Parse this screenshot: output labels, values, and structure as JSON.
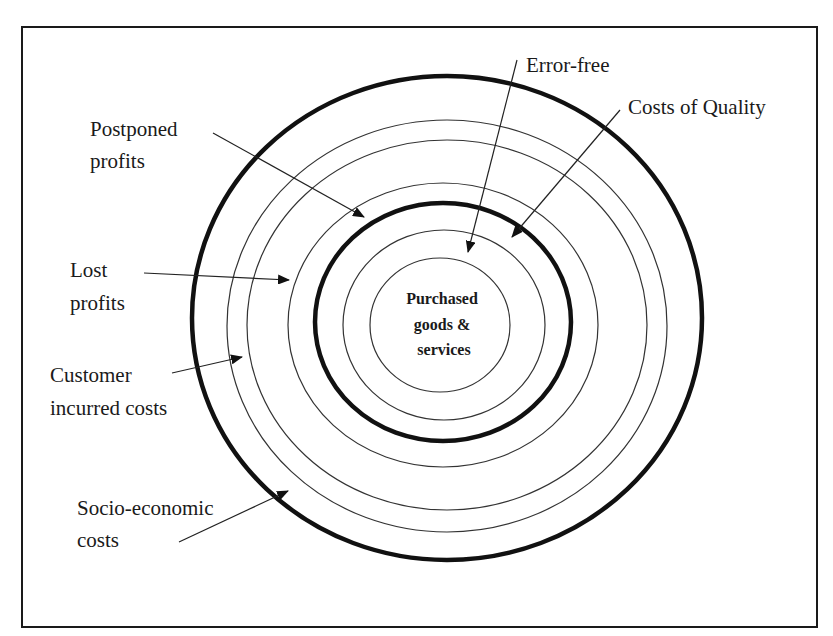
{
  "diagram": {
    "type": "concentric-rings",
    "center_label": {
      "lines": [
        "Purchased",
        "goods &",
        "services"
      ]
    },
    "labels": {
      "error_free": {
        "lines": [
          "Error-free"
        ]
      },
      "costs_of_quality": {
        "lines": [
          "Costs of Quality"
        ]
      },
      "postponed_profits": {
        "lines": [
          "Postponed",
          "profits"
        ]
      },
      "lost_profits": {
        "lines": [
          "Lost",
          "profits"
        ]
      },
      "customer_incurred_costs": {
        "lines": [
          "Customer",
          "incurred costs"
        ]
      },
      "socio_economic_costs": {
        "lines": [
          "Socio-economic",
          "costs"
        ]
      }
    },
    "rings_inner_to_outer": [
      "Purchased goods & services",
      "Error-free",
      "Costs of Quality (boundary, thick)",
      "Postponed profits",
      "Lost profits",
      "Customer incurred costs",
      "Socio-economic costs (boundary, thick)"
    ],
    "colors": {
      "stroke": "#111111",
      "background": "#ffffff"
    }
  }
}
